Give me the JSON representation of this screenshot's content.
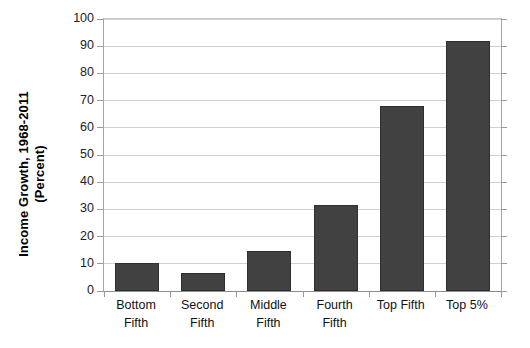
{
  "chart_data": {
    "type": "bar",
    "title": "",
    "subtitle": "",
    "xlabel": "",
    "ylabel": "Income Growth, 1968-2011 (Percent)",
    "ylabel_lines": [
      "Income Growth, 1968-2011",
      "(Percent)"
    ],
    "categories": [
      "Bottom Fifth",
      "Second Fifth",
      "Middle Fifth",
      "Fourth Fifth",
      "Top Fifth",
      "Top 5%"
    ],
    "category_label_lines": [
      [
        "Bottom",
        "Fifth"
      ],
      [
        "Second",
        "Fifth"
      ],
      [
        "Middle",
        "Fifth"
      ],
      [
        "Fourth",
        "Fifth"
      ],
      [
        "Top Fifth",
        ""
      ],
      [
        "Top 5%",
        ""
      ]
    ],
    "values": [
      10.3,
      6.6,
      14.7,
      31.6,
      68.0,
      92.0
    ],
    "ylim": [
      0,
      100
    ],
    "ytick_values": [
      0,
      10,
      20,
      30,
      40,
      50,
      60,
      70,
      80,
      90,
      100
    ],
    "ytick_labels": [
      "0",
      "10",
      "20",
      "30",
      "40",
      "50",
      "60",
      "70",
      "80",
      "90",
      "100"
    ],
    "grid": true,
    "grid_axis": "y",
    "legend": false,
    "legend_position": "none",
    "bar_color": "#414141",
    "bar_border_color": "#2f2f2f",
    "gridline_color": "#d0d0d0",
    "axis_color": "#9a9a9a",
    "background_color": "#ffffff",
    "text_color": "#111111"
  }
}
